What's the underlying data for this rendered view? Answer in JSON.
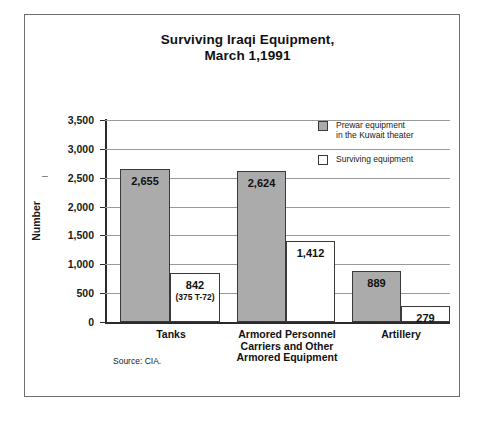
{
  "figure": {
    "title_line1": "Surviving Iraqi Equipment,",
    "title_line2": "March 1,1991",
    "source_note": "Source: CIA.",
    "axis_stub": "–"
  },
  "legend": {
    "position": "inside-top-right",
    "items": [
      {
        "label_line1": "Prewar equipment",
        "label_line2": "in the Kuwait theater",
        "swatch": "gray-square-icon",
        "color": "#ababab"
      },
      {
        "label_line1": "Surviving equipment",
        "label_line2": "",
        "swatch": "white-square-icon",
        "color": "#ffffff"
      }
    ]
  },
  "chart_data": {
    "type": "bar",
    "title": "Surviving Iraqi Equipment, March 1,1991",
    "xlabel": "",
    "ylabel": "Number",
    "ylim": [
      0,
      3500
    ],
    "ytick_labels": [
      "3,500",
      "3,000",
      "2,500",
      "2,000",
      "1,500",
      "1,000",
      "500",
      "0"
    ],
    "ytick_values": [
      3500,
      3000,
      2500,
      2000,
      1500,
      1000,
      500,
      0
    ],
    "grid": true,
    "grid_axis": "y",
    "categories": [
      "Tanks",
      "Armored Personnel Carriers and Other Armored Equipment",
      "Artillery"
    ],
    "category_label_lines": [
      [
        "Tanks"
      ],
      [
        "Armored Personnel",
        "Carriers and Other",
        "Armored Equipment"
      ],
      [
        "Artillery"
      ]
    ],
    "series": [
      {
        "name": "Prewar equipment in the Kuwait theater",
        "color": "#ababab",
        "values": [
          2655,
          2624,
          889
        ],
        "value_labels": [
          "2,655",
          "2,624",
          "889"
        ]
      },
      {
        "name": "Surviving equipment",
        "color": "#ffffff",
        "values": [
          842,
          1412,
          279
        ],
        "value_labels": [
          "842",
          "1,412",
          "279"
        ],
        "value_sublabels": [
          "(375 T-72)",
          "",
          ""
        ]
      }
    ],
    "source": "CIA"
  }
}
